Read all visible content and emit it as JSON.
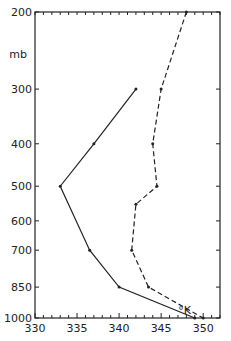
{
  "chart_data": {
    "type": "line",
    "title": "",
    "xlabel": "°K",
    "ylabel": "mb",
    "xlim": [
      330,
      352
    ],
    "ylim": [
      1000,
      200
    ],
    "yscale": "log",
    "xticks": [
      330,
      335,
      340,
      345,
      350
    ],
    "yticks": [
      200,
      300,
      400,
      500,
      600,
      700,
      850,
      1000
    ],
    "series": [
      {
        "name": "solid",
        "style": "solid",
        "points": [
          [
            342,
            300
          ],
          [
            337,
            400
          ],
          [
            333,
            500
          ],
          [
            336.5,
            700
          ],
          [
            340,
            850
          ],
          [
            349,
            1000
          ]
        ]
      },
      {
        "name": "dashed",
        "style": "dashed",
        "points": [
          [
            348,
            200
          ],
          [
            345,
            300
          ],
          [
            344,
            400
          ],
          [
            344.5,
            500
          ],
          [
            342,
            550
          ],
          [
            341.5,
            700
          ],
          [
            343.5,
            850
          ],
          [
            350,
            1000
          ]
        ]
      }
    ]
  }
}
